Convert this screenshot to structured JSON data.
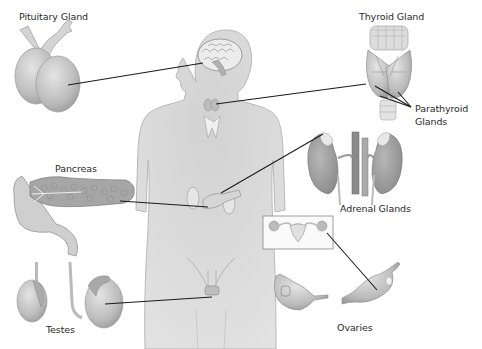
{
  "diagram": {
    "type": "anatomical-illustration",
    "labels": {
      "pituitary": "Pituitary Gland",
      "thyroid": "Thyroid Gland",
      "parathyroid_line1": "Parathyroid",
      "parathyroid_line2": "Glands",
      "pancreas": "Pancreas",
      "adrenal": "Adrenal Glands",
      "testes": "Testes",
      "ovaries": "Ovaries"
    },
    "colors": {
      "background": "#ffffff",
      "body_silhouette": "#dcdcdc",
      "body_outline": "#b8b8b8",
      "organ_fill": "#c8c8c8",
      "organ_dark": "#9a9a9a",
      "leader_line": "#1a1a1a",
      "label_text": "#2a2a2a"
    }
  }
}
